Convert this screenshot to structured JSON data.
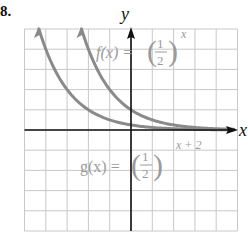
{
  "problem_number": "8.",
  "axes": {
    "x_label": "x",
    "y_label": "y",
    "x_range": [
      -5,
      5
    ],
    "y_range": [
      -5,
      5
    ],
    "grid": true,
    "grid_step": 1
  },
  "functions": [
    {
      "name": "f",
      "label_lhs": "f(x) =",
      "base_num": "1",
      "base_den": "2",
      "exponent": "x",
      "expression": "(1/2)^x",
      "color": "#8a8a8a"
    },
    {
      "name": "g",
      "label_lhs": "g(x) =",
      "base_num": "1",
      "base_den": "2",
      "exponent": "x + 2",
      "expression": "(1/2)^(x+2)",
      "color": "#8a8a8a"
    }
  ],
  "colors": {
    "grid": "#c8c8c8",
    "axis": "#111111",
    "curve": "#8a8a8a",
    "label": "#9a9a9a"
  },
  "chart_data": {
    "type": "line",
    "title": "",
    "xlabel": "x",
    "ylabel": "y",
    "xlim": [
      -5,
      5
    ],
    "ylim": [
      -5,
      5
    ],
    "grid": true,
    "series": [
      {
        "name": "f(x) = (1/2)^x",
        "x": [
          -2.32,
          -2,
          -1,
          0,
          1,
          2,
          3,
          4,
          5
        ],
        "values": [
          5,
          4,
          2,
          1,
          0.5,
          0.25,
          0.125,
          0.0625,
          0.03125
        ]
      },
      {
        "name": "g(x) = (1/2)^(x+2)",
        "x": [
          -4.32,
          -4,
          -3,
          -2,
          -1,
          0,
          1,
          2,
          3,
          4,
          5
        ],
        "values": [
          5,
          4,
          2,
          1,
          0.5,
          0.25,
          0.125,
          0.0625,
          0.03125,
          0.015625,
          0.0078125
        ]
      }
    ],
    "annotations": [
      "f(x) = (1/2)^x",
      "g(x) = (1/2)^(x+2)"
    ]
  }
}
